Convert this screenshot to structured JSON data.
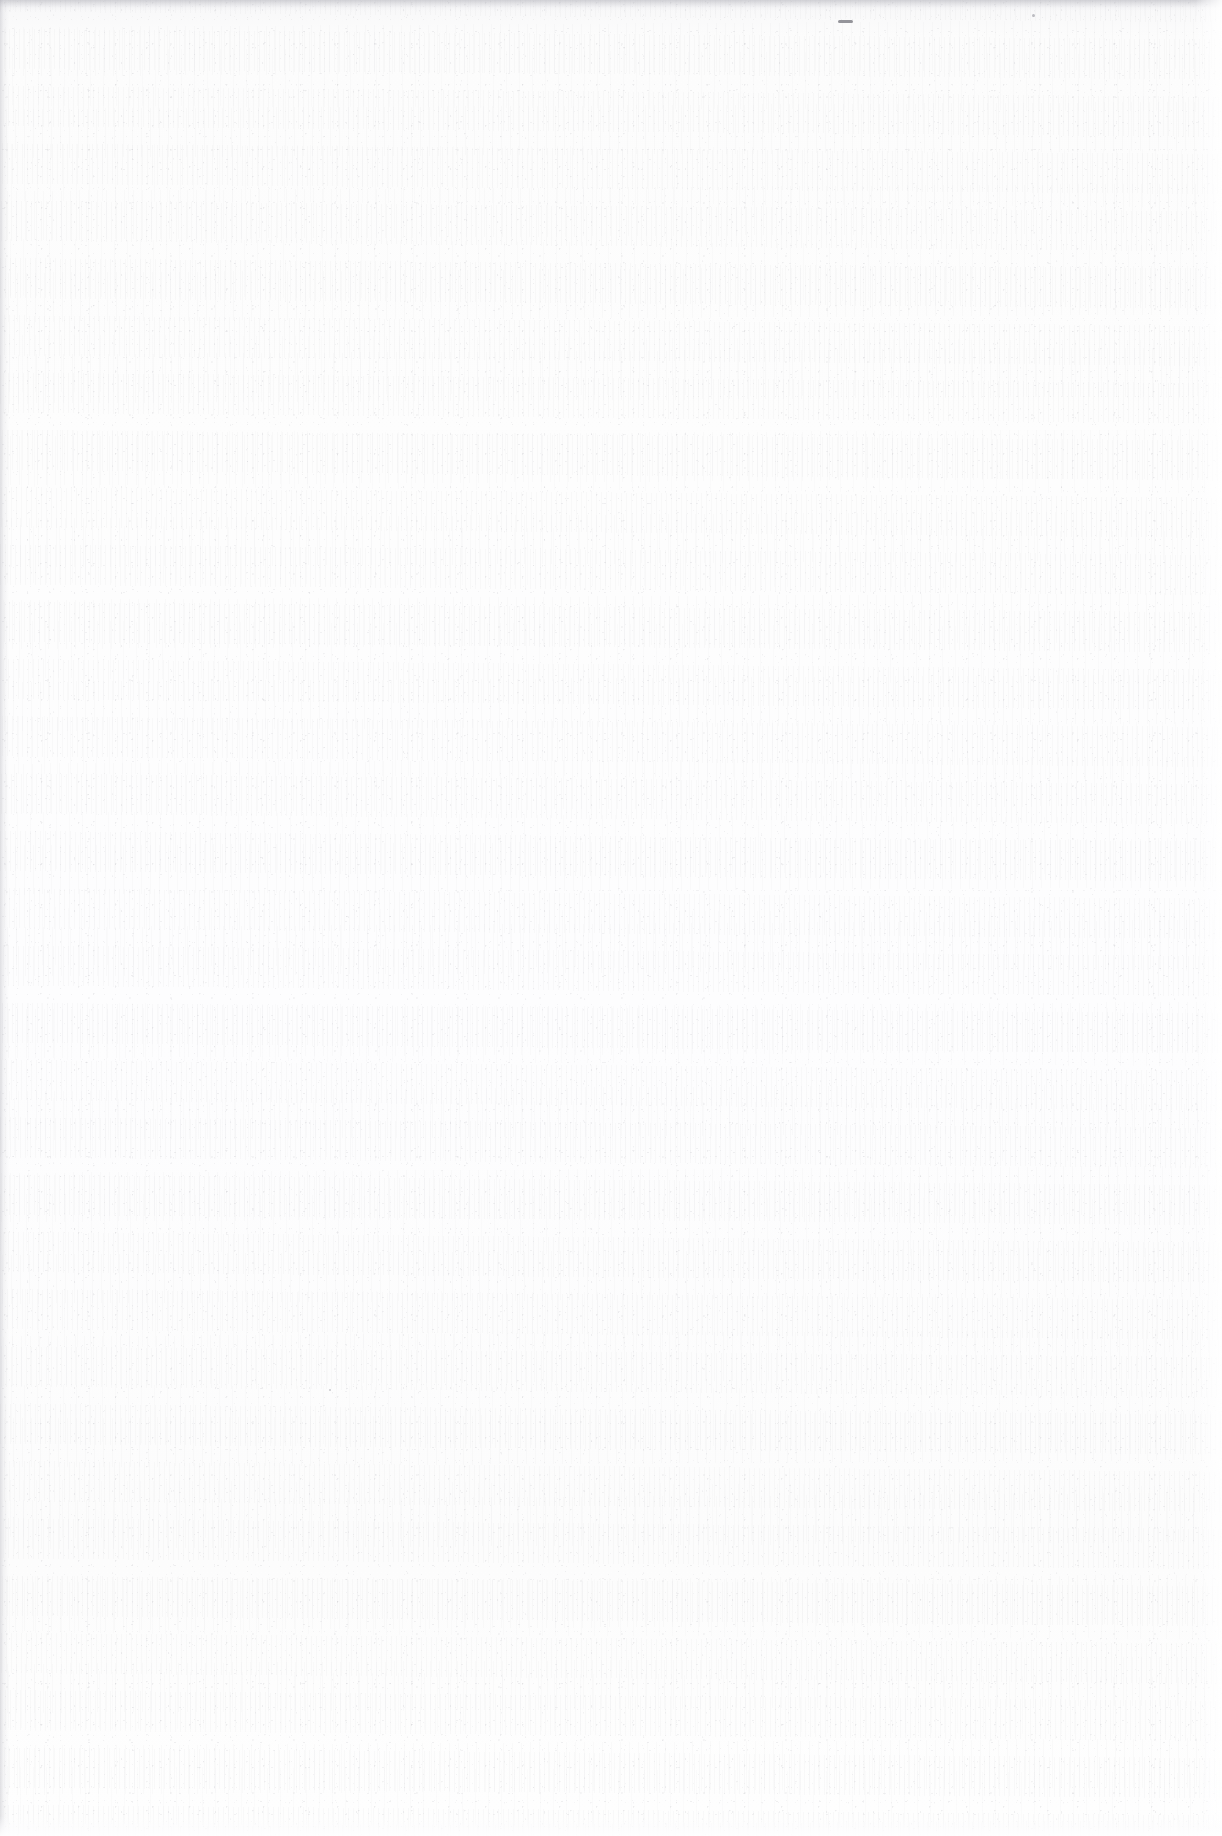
{
  "document": {
    "kind": "scanned-page",
    "content_state": "blank",
    "description": "Blank scanned document page with paper grain texture",
    "visible_text": "",
    "page_width": 1222,
    "page_height": 1836
  },
  "colors": {
    "paper": "#fdfdfd",
    "paper_shadow": "#f7f7f8",
    "grain": "#96969e",
    "edge_top": "#b0b0b8",
    "speck": "#6e6e76",
    "ghost_text": "#5a5a66"
  },
  "artifacts": {
    "top_edge_label": "scanner top edge shadow",
    "bottom_edge_label": "page bottom edge highlight",
    "left_edge_label": "page left edge shadow",
    "right_edge_label": "page right margin highlight",
    "speck_label": "dark scan speck",
    "ghost_label": "faint illegible bleed-through"
  },
  "ghost": {
    "line_1": "              ",
    "line_2": "           "
  }
}
